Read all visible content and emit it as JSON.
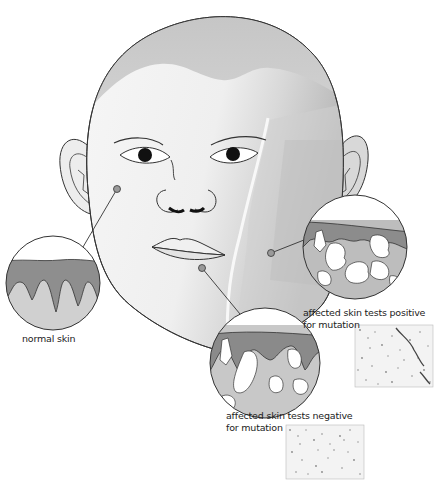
{
  "figure": {
    "type": "medical-illustration",
    "colors": {
      "outline": "#333333",
      "skin_light": "#f2f2f2",
      "skin_mid": "#d6d6d6",
      "skin_dark": "#a9a9a9",
      "epidermis": "#8c8c8c",
      "dermis": "#c9c9c9",
      "pointer_dot": "#9a9a9a"
    }
  },
  "callouts": [
    {
      "id": "normal",
      "label": "normal skin",
      "pointer": "cheek-left"
    },
    {
      "id": "positive",
      "label_line1": "affected skin tests positive",
      "label_line2": "for mutation",
      "pointer": "jaw-right",
      "has_micrograph": true
    },
    {
      "id": "negative",
      "label_line1": "affected skin tests negative",
      "label_line2": "for mutation",
      "pointer": "chin",
      "has_micrograph": true
    }
  ],
  "caption": {
    "visible": "partially cut off at bottom edge"
  }
}
